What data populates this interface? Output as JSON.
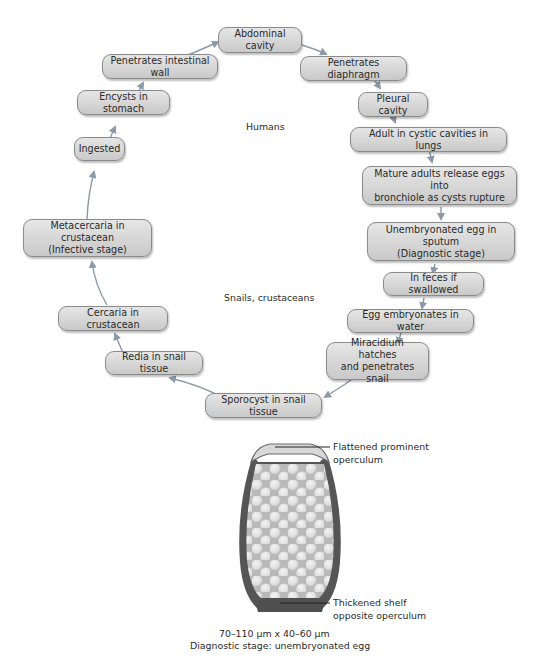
{
  "diagram": {
    "type": "life-cycle",
    "region_labels": {
      "humans": "Humans",
      "snails_crustaceans": "Snails, crustaceans"
    },
    "stages": [
      {
        "id": "abdominal-cavity",
        "label": "Abdominal cavity"
      },
      {
        "id": "penetrates-diaphragm",
        "label": "Penetrates diaphragm"
      },
      {
        "id": "pleural-cavity",
        "label": "Pleural cavity"
      },
      {
        "id": "adult-lungs",
        "label": "Adult in cystic cavities in lungs"
      },
      {
        "id": "mature-adults",
        "label": "Mature adults release eggs into bronchiole as cysts rupture"
      },
      {
        "id": "unembryonated-egg",
        "label": "Unembryonated egg in sputum (Diagnostic stage)"
      },
      {
        "id": "in-feces",
        "label": "In feces if swallowed"
      },
      {
        "id": "egg-embryonates",
        "label": "Egg embryonates in water"
      },
      {
        "id": "miracidium",
        "label": "Miracidium hatches and penetrates snail"
      },
      {
        "id": "sporocyst",
        "label": "Sporocyst in snail tissue"
      },
      {
        "id": "redia",
        "label": "Redia in snail tissue"
      },
      {
        "id": "cercaria",
        "label": "Cercaria in crustacean"
      },
      {
        "id": "metacercaria",
        "label": "Metacercaria in crustacean (Infective stage)"
      },
      {
        "id": "ingested",
        "label": "Ingested"
      },
      {
        "id": "encysts",
        "label": "Encysts in stomach"
      },
      {
        "id": "penetrates-intestinal",
        "label": "Penetrates intestinal wall"
      }
    ],
    "boxes": {
      "abdominal_cavity": "Abdominal cavity",
      "penetrates_diaphragm": "Penetrates diaphragm",
      "pleural_cavity": "Pleural cavity",
      "adult_lungs": "Adult in cystic cavities in lungs",
      "mature_adults_1": "Mature adults release eggs into",
      "mature_adults_2": "bronchiole as cysts rupture",
      "unembryonated_1": "Unembryonated egg in sputum",
      "unembryonated_2": "(Diagnostic stage)",
      "in_feces": "In feces if swallowed",
      "egg_embryonates": "Egg embryonates in water",
      "miracidium_1": "Miracidium hatches",
      "miracidium_2": "and penetrates snail",
      "sporocyst": "Sporocyst in snail tissue",
      "redia": "Redia in snail tissue",
      "cercaria": "Cercaria in crustacean",
      "metacercaria_1": "Metacercaria in crustacean",
      "metacercaria_2": "(Infective stage)",
      "ingested": "Ingested",
      "encysts": "Encysts in stomach",
      "penetrates_intestinal": "Penetrates intestinal wall"
    },
    "egg_illustration": {
      "callout_top_1": "Flattened prominent",
      "callout_top_2": "operculum",
      "callout_bottom_1": "Thickened shelf",
      "callout_bottom_2": "opposite operculum",
      "caption_size": "70–110 µm x 40–60 µm",
      "caption_stage": "Diagnostic stage: unembryonated egg"
    },
    "colors": {
      "box_fill_top": "#e6e6e6",
      "box_fill_bottom": "#c9c9c9",
      "box_border": "#8a8a8a",
      "arrow": "#8c9aa8",
      "egg_shell": "#555555",
      "egg_interior": "#b8b8b8"
    }
  }
}
